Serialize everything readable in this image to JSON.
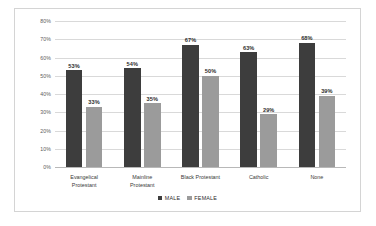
{
  "chart_data": {
    "type": "bar",
    "title": "",
    "xlabel": "",
    "ylabel": "",
    "ylim": [
      0,
      80
    ],
    "grid": true,
    "legend_position": "bottom-center",
    "categories": [
      "Evangelical Protestant",
      "Mainline Protestant",
      "Black Protestant",
      "Catholic",
      "None"
    ],
    "category_lines": [
      [
        "Evangelical",
        "Protestant"
      ],
      [
        "Mainline",
        "Protestant"
      ],
      [
        "Black Protestant"
      ],
      [
        "Catholic"
      ],
      [
        "None"
      ]
    ],
    "series": [
      {
        "name": "MALE",
        "color": "#3d3d3d",
        "values": [
          53,
          54,
          67,
          63,
          68
        ],
        "labels": [
          "53%",
          "54%",
          "67%",
          "63%",
          "68%"
        ]
      },
      {
        "name": "FEMALE",
        "color": "#9b9b9b",
        "values": [
          33,
          35,
          50,
          29,
          39
        ],
        "labels": [
          "33%",
          "35%",
          "50%",
          "29%",
          "39%"
        ]
      }
    ],
    "y_ticks": [
      0,
      10,
      20,
      30,
      40,
      50,
      60,
      70,
      80
    ],
    "y_tick_labels": [
      "0%",
      "10%",
      "20%",
      "30%",
      "40%",
      "50%",
      "60%",
      "70%",
      "80%"
    ]
  },
  "legend": {
    "items": [
      {
        "label": "MALE"
      },
      {
        "label": "FEMALE"
      }
    ]
  },
  "colors": {
    "male": "#3d3d3d",
    "female": "#9b9b9b",
    "gridline": "#d9d9d9",
    "frame_border": "#d4d4d4",
    "background": "#ffffff"
  }
}
